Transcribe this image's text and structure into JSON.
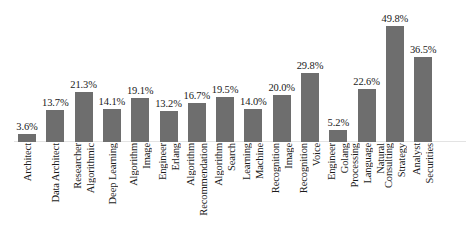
{
  "chart_data": {
    "type": "bar",
    "title": "",
    "subtitle": "",
    "xlabel": "",
    "ylabel": "",
    "grid": false,
    "legend": false,
    "ylim": [
      0,
      52
    ],
    "bar_color": "#6e6e6e",
    "background_color": "#ffffff",
    "categories": [
      "Architect",
      "Data Architect",
      "Algorithmic Researcher",
      "Deep Learning",
      "Image Algorithm",
      "Erlang Engineer",
      "Recommendation Algorithm",
      "Search Algorithm",
      "Machine Learning",
      "Image Recognition",
      "Voice Recognition",
      "Golang Engineer",
      "Natural Language Processing",
      "Strategy Consulting",
      "Securities Analyst"
    ],
    "category_lines": [
      [
        "Architect"
      ],
      [
        "Data Architect"
      ],
      [
        "Algorithmic",
        "Researcher"
      ],
      [
        "Deep Learning"
      ],
      [
        "Image",
        "Algorithm"
      ],
      [
        "Erlang",
        "Engineer"
      ],
      [
        "Recommendation",
        "Algorithm"
      ],
      [
        "Search",
        "Algorithm"
      ],
      [
        "Machine",
        "Learning"
      ],
      [
        "Image",
        "Recognition"
      ],
      [
        "Voice",
        "Recognition"
      ],
      [
        "Golang",
        "Engineer"
      ],
      [
        "Natural",
        "Language",
        "Processing"
      ],
      [
        "Strategy",
        "Consulting"
      ],
      [
        "Securities",
        "Analyst"
      ]
    ],
    "values": [
      3.6,
      13.7,
      21.3,
      14.1,
      19.1,
      13.2,
      16.7,
      19.5,
      14.0,
      20.0,
      29.8,
      5.2,
      22.6,
      49.8,
      36.5
    ],
    "value_labels": [
      "3.6%",
      "13.7%",
      "21.3%",
      "14.1%",
      "19.1%",
      "13.2%",
      "16.7%",
      "19.5%",
      "14.0%",
      "20.0%",
      "29.8%",
      "5.2%",
      "22.6%",
      "49.8%",
      "36.5%"
    ]
  }
}
